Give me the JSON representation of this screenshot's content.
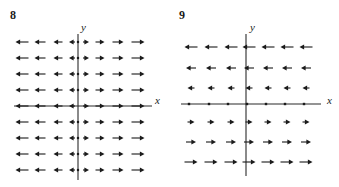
{
  "figure": {
    "background": "#ffffff",
    "ink": "#1b1b1b",
    "axis_color": "#2a2a2a"
  },
  "panels": [
    {
      "number": "8",
      "number_pos": {
        "x": 10,
        "y": 9
      },
      "axis_x_label": "x",
      "axis_y_label": "y",
      "x_label_pos": {
        "x": 155,
        "y": 95
      },
      "y_label_pos": {
        "x": 81,
        "y": 22
      },
      "origin": {
        "x": 78,
        "y": 106
      },
      "x_axis": {
        "x1": 14,
        "x2": 152,
        "y": 106
      },
      "y_axis": {
        "x": 78,
        "y1": 34,
        "y2": 180
      },
      "chart_data": {
        "type": "slope-field",
        "title": "8",
        "xlabel": "x",
        "ylabel": "y",
        "description": "Direction field of horizontal vectors pointing away from the y-axis; magnitude increases with |x| and is independent of y.",
        "columns_x": [
          22,
          40,
          58,
          72,
          86,
          100,
          118,
          138
        ],
        "rows_y": [
          42,
          58,
          74,
          90,
          106,
          122,
          138,
          154,
          170
        ],
        "column_signs": [
          -1,
          -1,
          -1,
          -1,
          1,
          1,
          1,
          1
        ],
        "column_lengths": [
          13,
          11,
          9,
          6,
          6,
          9,
          11,
          13
        ],
        "arrow_direction_rule": "sign(x)",
        "magnitude_rule": "proportional to |x|",
        "axis_row_index": 4,
        "y_axis_dot_rows": [
          42,
          58,
          74,
          90,
          122,
          138,
          154,
          170
        ]
      }
    },
    {
      "number": "9",
      "number_pos": {
        "x": 10,
        "y": 9
      },
      "axis_x_label": "x",
      "axis_y_label": "y",
      "x_label_pos": {
        "x": 158,
        "y": 95
      },
      "y_label_pos": {
        "x": 81,
        "y": 22
      },
      "origin": {
        "x": 77,
        "y": 104
      },
      "x_axis": {
        "x1": 12,
        "x2": 152,
        "y": 104
      },
      "y_axis": {
        "x": 77,
        "y1": 34,
        "y2": 176
      },
      "chart_data": {
        "type": "slope-field",
        "title": "9",
        "xlabel": "x",
        "ylabel": "y",
        "description": "Direction field of horizontal vectors pointing left above the x-axis and right below it; magnitude increases with |y| and is independent of x.",
        "columns_x": [
          22,
          42,
          62,
          80,
          99,
          118,
          137
        ],
        "rows_y": [
          47,
          68,
          88,
          122,
          142,
          162
        ],
        "row_signs": [
          -1,
          -1,
          -1,
          1,
          1,
          1
        ],
        "row_lengths": [
          13,
          10,
          7,
          7,
          10,
          13
        ],
        "arrow_direction_rule": "-sign(y)",
        "magnitude_rule": "proportional to |y|",
        "x_axis_dot_columns": [
          20,
          40,
          59,
          78,
          97,
          116,
          135
        ],
        "has_axis_arrows": false
      }
    }
  ]
}
